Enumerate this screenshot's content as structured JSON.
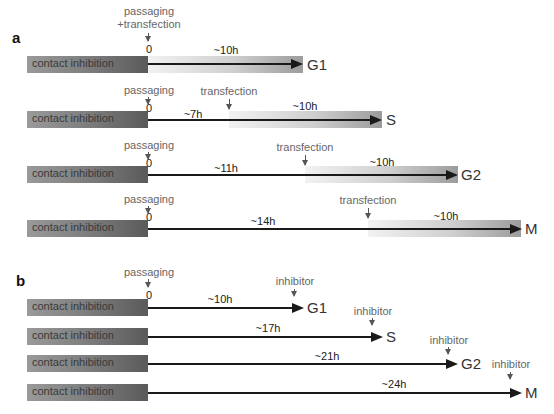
{
  "panel_a": {
    "label": "a",
    "rows": [
      {
        "box": "contact inhibition",
        "start_label": "passaging\n+transfection",
        "zero": "0",
        "pre_duration": "",
        "transfection_label": "",
        "duration": "~10h",
        "phase": "G1"
      },
      {
        "box": "contact inhibition",
        "start_label": "passaging",
        "zero": "0",
        "pre_duration": "~7h",
        "transfection_label": "transfection",
        "duration": "~10h",
        "phase": "S"
      },
      {
        "box": "contact inhibition",
        "start_label": "passaging",
        "zero": "0",
        "pre_duration": "~11h",
        "transfection_label": "transfection",
        "duration": "~10h",
        "phase": "G2"
      },
      {
        "box": "contact inhibition",
        "start_label": "passaging",
        "zero": "0",
        "pre_duration": "~14h",
        "transfection_label": "transfection",
        "duration": "~10h",
        "phase": "M"
      }
    ]
  },
  "panel_b": {
    "label": "b",
    "start_label": "passaging",
    "zero": "0",
    "rows": [
      {
        "box": "contact inhibition",
        "duration": "~10h",
        "marker": "inhibitor",
        "phase": "G1"
      },
      {
        "box": "contact inhibition",
        "duration": "~17h",
        "marker": "inhibitor",
        "phase": "S"
      },
      {
        "box": "contact inhibition",
        "duration": "~21h",
        "marker": "inhibitor",
        "phase": "G2"
      },
      {
        "box": "contact inhibition",
        "duration": "~24h",
        "marker": "inhibitor",
        "phase": "M"
      }
    ]
  }
}
